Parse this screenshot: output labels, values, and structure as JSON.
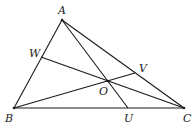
{
  "diagram": {
    "points": {
      "A": {
        "label": "A",
        "x": 62,
        "y": 20,
        "lx": 58,
        "ly": 14
      },
      "B": {
        "label": "B",
        "x": 14,
        "y": 108,
        "lx": 5,
        "ly": 122
      },
      "C": {
        "label": "C",
        "x": 184,
        "y": 108,
        "lx": 183,
        "ly": 122
      },
      "U": {
        "label": "U",
        "x": 128,
        "y": 108,
        "lx": 124,
        "ly": 122
      },
      "V": {
        "label": "V",
        "x": 135,
        "y": 73,
        "lx": 139,
        "ly": 72
      },
      "W": {
        "label": "W",
        "x": 41,
        "y": 57,
        "lx": 29,
        "ly": 57
      },
      "O": {
        "label": "O",
        "x": 108,
        "y": 81,
        "lx": 99,
        "ly": 95
      }
    },
    "segments": [
      {
        "from": "A",
        "to": "B"
      },
      {
        "from": "B",
        "to": "C"
      },
      {
        "from": "A",
        "to": "C"
      },
      {
        "from": "A",
        "to": "U"
      },
      {
        "from": "B",
        "to": "V"
      },
      {
        "from": "W",
        "to": "C"
      }
    ],
    "colors": {
      "stroke": "#1a1a1a",
      "background": "#ffffff"
    }
  }
}
